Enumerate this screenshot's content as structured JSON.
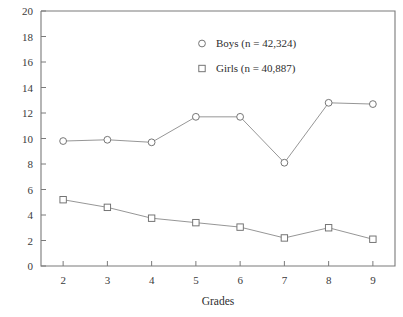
{
  "chart_data": {
    "type": "line",
    "title": "",
    "subtitle": "",
    "xlabel": "Grades",
    "ylabel": "",
    "categories": [
      "2",
      "3",
      "4",
      "5",
      "6",
      "7",
      "8",
      "9"
    ],
    "x": [
      2,
      3,
      4,
      5,
      6,
      7,
      8,
      9
    ],
    "xlim": [
      1.5,
      9.5
    ],
    "ylim": [
      0,
      20
    ],
    "ytick_labels": [
      "0",
      "2",
      "4",
      "6",
      "8",
      "10",
      "12",
      "14",
      "16",
      "18",
      "20"
    ],
    "yticks": [
      0,
      2,
      4,
      6,
      8,
      10,
      12,
      14,
      16,
      18,
      20
    ],
    "xtick_labels": [
      "2",
      "3",
      "4",
      "5",
      "6",
      "7",
      "8",
      "9"
    ],
    "grid": false,
    "legend_position": "upper-center",
    "series": [
      {
        "name": "Boys (n = 42,324)",
        "marker": "circle",
        "values": [
          9.8,
          9.9,
          9.7,
          11.7,
          11.7,
          8.1,
          12.8,
          12.7
        ]
      },
      {
        "name": "Girls (n = 40,887)",
        "marker": "square",
        "values": [
          5.2,
          4.6,
          3.75,
          3.4,
          3.05,
          2.2,
          3.0,
          2.1
        ]
      }
    ]
  },
  "legend": {
    "entries": [
      {
        "label": "Boys (n = 42,324)",
        "marker": "circle-marker-icon"
      },
      {
        "label": "Girls (n = 40,887)",
        "marker": "square-marker-icon"
      }
    ]
  },
  "colors": {
    "background": "#ffffff",
    "axis": "#7a7a7a",
    "line": "#8a8a8a",
    "marker_stroke": "#6e6e6e",
    "text": "#2e2e2e"
  }
}
